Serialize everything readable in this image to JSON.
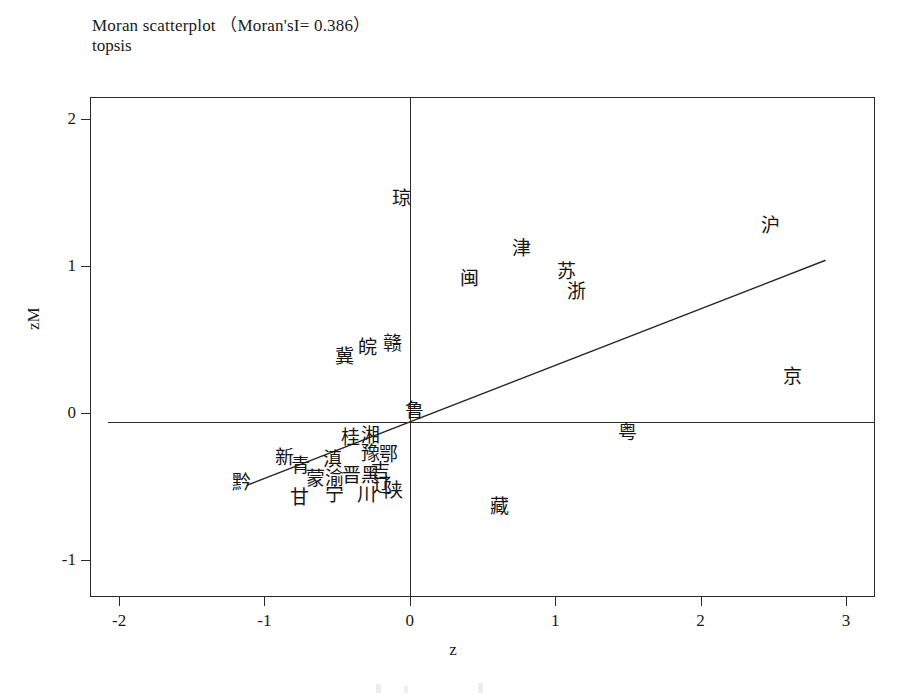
{
  "title": {
    "line1": "Moran scatterplot （Moran'sI= 0.386）",
    "line2": "topsis"
  },
  "chart_data": {
    "type": "scatter",
    "title": "Moran scatterplot （Moran'sI= 0.386）",
    "subtitle": "topsis",
    "xlabel": "z",
    "ylabel": "zM",
    "xlim": [
      -2.2,
      3.2
    ],
    "ylim": [
      -1.25,
      2.15
    ],
    "xticks": [
      "-2",
      "-1",
      "0",
      "1",
      "2",
      "3"
    ],
    "xtick_values": [
      -2,
      -1,
      0,
      1,
      2,
      3
    ],
    "yticks": [
      "2",
      "1",
      "0",
      "-1"
    ],
    "ytick_values": [
      2,
      1,
      0,
      -1
    ],
    "grid": false,
    "legend": null,
    "morans_i": 0.386,
    "reference_lines": [
      {
        "name": "vertical-mean-line",
        "type": "vertical",
        "x": 0.0
      },
      {
        "name": "horizontal-mean-line",
        "type": "horizontal",
        "y": -0.06
      }
    ],
    "fit_line": {
      "name": "moran-regression-line",
      "slope": 0.386,
      "intercept": -0.06,
      "x_start": -1.12,
      "y_start": -0.49,
      "x_end": 2.86,
      "y_end": 1.04
    },
    "points": [
      {
        "label": "琼",
        "x": -0.06,
        "y": 1.46
      },
      {
        "label": "沪",
        "x": 2.48,
        "y": 1.28
      },
      {
        "label": "津",
        "x": 0.77,
        "y": 1.12
      },
      {
        "label": "苏",
        "x": 1.08,
        "y": 0.97
      },
      {
        "label": "闽",
        "x": 0.41,
        "y": 0.92
      },
      {
        "label": "浙",
        "x": 1.15,
        "y": 0.83
      },
      {
        "label": "赣",
        "x": -0.12,
        "y": 0.48
      },
      {
        "label": "皖",
        "x": -0.29,
        "y": 0.45
      },
      {
        "label": "冀",
        "x": -0.45,
        "y": 0.39
      },
      {
        "label": "京",
        "x": 2.63,
        "y": 0.25
      },
      {
        "label": "鲁",
        "x": 0.03,
        "y": 0.02
      },
      {
        "label": "粤",
        "x": 1.5,
        "y": -0.13
      },
      {
        "label": "桂",
        "x": -0.41,
        "y": -0.16
      },
      {
        "label": "湘",
        "x": -0.27,
        "y": -0.15
      },
      {
        "label": "豫",
        "x": -0.27,
        "y": -0.27
      },
      {
        "label": "鄂",
        "x": -0.15,
        "y": -0.28
      },
      {
        "label": "新",
        "x": -0.86,
        "y": -0.3
      },
      {
        "label": "滇",
        "x": -0.53,
        "y": -0.31
      },
      {
        "label": "青",
        "x": -0.75,
        "y": -0.35
      },
      {
        "label": "吉",
        "x": -0.2,
        "y": -0.39
      },
      {
        "label": "晋",
        "x": -0.4,
        "y": -0.42
      },
      {
        "label": "黑",
        "x": -0.27,
        "y": -0.42
      },
      {
        "label": "蒙",
        "x": -0.65,
        "y": -0.44
      },
      {
        "label": "渝",
        "x": -0.52,
        "y": -0.44
      },
      {
        "label": "黔",
        "x": -1.16,
        "y": -0.47
      },
      {
        "label": "辽",
        "x": -0.19,
        "y": -0.49
      },
      {
        "label": "陕",
        "x": -0.11,
        "y": -0.52
      },
      {
        "label": "川",
        "x": -0.3,
        "y": -0.55
      },
      {
        "label": "宁",
        "x": -0.52,
        "y": -0.55
      },
      {
        "label": "甘",
        "x": -0.76,
        "y": -0.57
      },
      {
        "label": "藏",
        "x": 0.62,
        "y": -0.63
      }
    ]
  }
}
